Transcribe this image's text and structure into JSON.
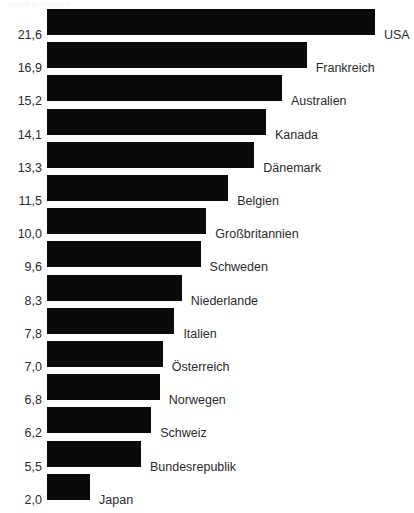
{
  "chart_title_faint": "Anteil in Prozent",
  "chart_data": {
    "type": "bar",
    "orientation": "horizontal",
    "title": "",
    "subtitle": "",
    "xlabel": "",
    "ylabel": "",
    "grid": false,
    "legend": "none",
    "bar_color": "#0a0a0a",
    "background_color": "#ffffff",
    "text_color": "#2b2b2b",
    "decimal_separator": ",",
    "xlim": [
      0,
      21.6
    ],
    "categories": [
      "USA",
      "Frankreich",
      "Australien",
      "Kanada",
      "Dänemark",
      "Belgien",
      "Großbritannien",
      "Schweden",
      "Niederlande",
      "Italien",
      "Österreich",
      "Norwegen",
      "Schweiz",
      "Bundesrepublik",
      "Japan"
    ],
    "values": [
      21.6,
      16.9,
      15.2,
      14.1,
      13.3,
      11.5,
      10.0,
      9.6,
      8.3,
      7.8,
      7.0,
      6.8,
      6.2,
      5.5,
      2.0
    ],
    "value_labels": [
      "21,6",
      "16,9",
      "15,2",
      "14,1",
      "13,3",
      "11,5",
      "10,0",
      "9,6",
      "8,3",
      "7,8",
      "7,0",
      "6,8",
      "6,2",
      "5,5",
      "2,0"
    ]
  }
}
